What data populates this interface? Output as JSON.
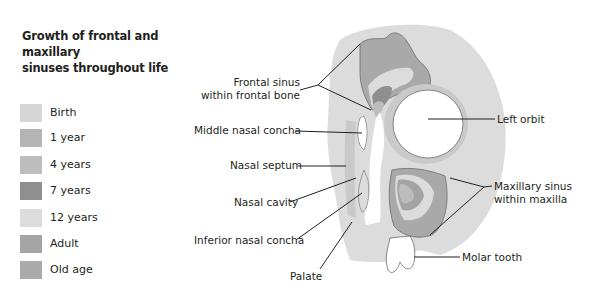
{
  "title": "Growth of frontal and maxillary sinuses throughout life",
  "title_lines": [
    "Growth of frontal and maxillary",
    "sinuses throughout life"
  ],
  "legend": {
    "items": [
      {
        "label": "Birth",
        "color": "#d6d6d6"
      },
      {
        "label": "1 year",
        "color": "#b4b4b4"
      },
      {
        "label": "4 years",
        "color": "#bdbdbd"
      },
      {
        "label": "7 years",
        "color": "#8f8f8f"
      },
      {
        "label": "12 years",
        "color": "#dcdcdc"
      },
      {
        "label": "Adult",
        "color": "#a4a4a4"
      },
      {
        "label": "Old age",
        "color": "#aaaaaa"
      }
    ]
  },
  "labels": {
    "frontal_sinus_line1": "Frontal sinus",
    "frontal_sinus_line2": "within frontal bone",
    "middle_nasal_concha": "Middle nasal concha",
    "nasal_septum": "Nasal septum",
    "nasal_cavity": "Nasal cavity",
    "inferior_nasal_concha": "Inferior nasal concha",
    "palate": "Palate",
    "left_orbit": "Left orbit",
    "maxillary_sinus_line1": "Maxillary sinus",
    "maxillary_sinus_line2": "within maxilla",
    "molar_tooth": "Molar tooth"
  },
  "colors": {
    "bone_background": "#dcdcdc",
    "bone_mid": "#c9c9c9",
    "outline": "#6b6b6b",
    "leader": "#231f20",
    "orbit_fill": "#ffffff"
  }
}
